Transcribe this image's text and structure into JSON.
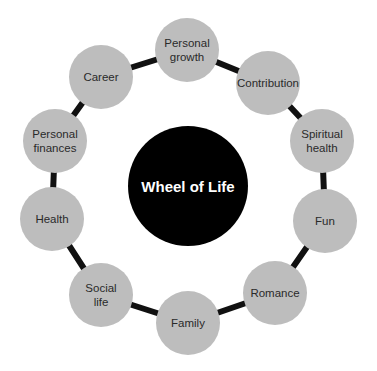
{
  "diagram": {
    "type": "cycle",
    "center": {
      "label": "Wheel of Life",
      "x": 188,
      "y": 186,
      "r": 60,
      "color": "#000000",
      "text_color": "#ffffff"
    },
    "ring": {
      "cx": 188,
      "cy": 187,
      "r": 137,
      "stroke": "#111111",
      "stroke_width": 6
    },
    "node_style": {
      "r": 32,
      "fill": "#bdbdbd",
      "text_color": "#2a2a2a"
    },
    "nodes": [
      {
        "id": "personal-growth",
        "lines": [
          "Personal",
          "growth"
        ],
        "x": 187,
        "y": 50
      },
      {
        "id": "contribution",
        "lines": [
          "Contribution"
        ],
        "x": 268,
        "y": 83
      },
      {
        "id": "spiritual-health",
        "lines": [
          "Spiritual",
          "health"
        ],
        "x": 322,
        "y": 141
      },
      {
        "id": "fun",
        "lines": [
          "Fun"
        ],
        "x": 325,
        "y": 221
      },
      {
        "id": "romance",
        "lines": [
          "Romance"
        ],
        "x": 275,
        "y": 293
      },
      {
        "id": "family",
        "lines": [
          "Family"
        ],
        "x": 188,
        "y": 323
      },
      {
        "id": "social-life",
        "lines": [
          "Social",
          "life"
        ],
        "x": 101,
        "y": 295
      },
      {
        "id": "health",
        "lines": [
          "Health"
        ],
        "x": 52,
        "y": 219
      },
      {
        "id": "personal-finances",
        "lines": [
          "Personal",
          "finances"
        ],
        "x": 55,
        "y": 141
      },
      {
        "id": "career",
        "lines": [
          "Career"
        ],
        "x": 101,
        "y": 77
      }
    ]
  }
}
